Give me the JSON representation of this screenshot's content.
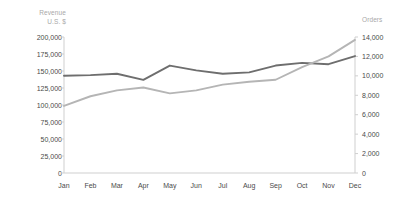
{
  "chart_data": {
    "type": "line",
    "title": "",
    "categories": [
      "Jan",
      "Feb",
      "Mar",
      "Apr",
      "May",
      "Jun",
      "Jul",
      "Aug",
      "Sep",
      "Oct",
      "Nov",
      "Dec"
    ],
    "xlabel": "",
    "grid": false,
    "legend": "none",
    "axes": {
      "left": {
        "label": "Revenue\nU.S. $",
        "ylim": [
          0,
          200000
        ],
        "tick_step": 25000,
        "ticks": [
          "200,000",
          "175,000",
          "150,000",
          "125,000",
          "100,000",
          "75,000",
          "50,000",
          "25,000",
          "0"
        ],
        "tick_values": [
          200000,
          175000,
          150000,
          125000,
          100000,
          75000,
          50000,
          25000,
          0
        ]
      },
      "right": {
        "label": "Orders",
        "ylim": [
          0,
          14000
        ],
        "tick_step": 2000,
        "ticks": [
          "14,000",
          "12,000",
          "10,000",
          "8,000",
          "6,000",
          "4,000",
          "2,000",
          "0"
        ],
        "tick_values": [
          14000,
          12000,
          10000,
          8000,
          6000,
          4000,
          2000,
          0
        ]
      }
    },
    "series": [
      {
        "name": "Revenue",
        "axis": "left",
        "color": "#6e6e6e",
        "values": [
          143000,
          144000,
          146000,
          137000,
          158000,
          151000,
          146000,
          148000,
          158000,
          162000,
          160000,
          172000
        ]
      },
      {
        "name": "Orders",
        "axis": "right",
        "color": "#b5b5b5",
        "values": [
          6900,
          7900,
          8500,
          8800,
          8200,
          8500,
          9100,
          9400,
          9600,
          10900,
          12000,
          13700
        ]
      }
    ]
  }
}
